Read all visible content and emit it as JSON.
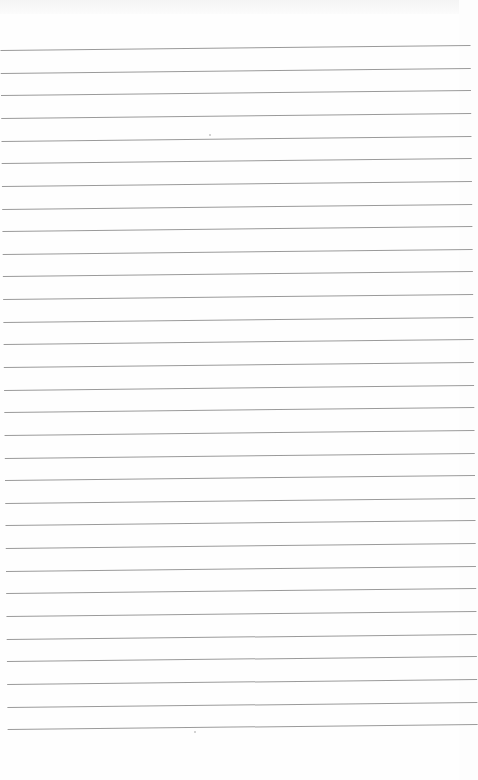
{
  "page": {
    "type": "lined-paper",
    "background_color": "#fefefe",
    "rule_color": "#9a9a9a",
    "rule_count": 31,
    "first_rule_y": 50,
    "rule_spacing": 22.64
  }
}
